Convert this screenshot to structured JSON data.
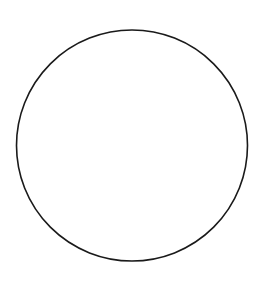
{
  "figure": {
    "background": "#ffffff",
    "shapes": [
      {
        "type": "circle",
        "cx": 132,
        "cy": 145.5,
        "r": 115.5,
        "stroke": "#1a1a1a",
        "stroke_width": 1.6,
        "fill": "none"
      }
    ]
  }
}
